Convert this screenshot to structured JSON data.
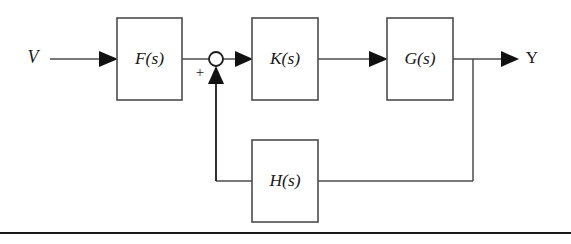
{
  "figure": {
    "kind": "control-system-block-diagram",
    "width": 571,
    "height": 244,
    "background_color": "#ffffff",
    "line_color": "#4d4d4d",
    "accent_color": "#1a1a1a"
  },
  "blocks": [
    {
      "id": "F",
      "label": "F(s)",
      "x": 117,
      "y": 18,
      "w": 65,
      "h": 82
    },
    {
      "id": "K",
      "label": "K(s)",
      "x": 252,
      "y": 18,
      "w": 66,
      "h": 82
    },
    {
      "id": "G",
      "label": "G(s)",
      "x": 387,
      "y": 18,
      "w": 66,
      "h": 82
    },
    {
      "id": "H",
      "label": "H(s)",
      "x": 252,
      "y": 140,
      "w": 66,
      "h": 82
    }
  ],
  "signals": {
    "input_label": "V",
    "output_label": "Y",
    "summing_sign": "+"
  },
  "summing_junction": {
    "cx": 216,
    "cy": 59,
    "r": 7,
    "sign": "+",
    "sign_x": 200,
    "sign_y": 73
  },
  "footer_rule": {
    "y": 233,
    "x1": 0,
    "x2": 571
  }
}
